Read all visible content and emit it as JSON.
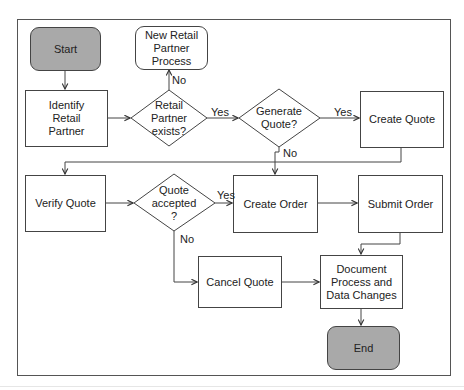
{
  "diagram": {
    "type": "flowchart",
    "nodes": {
      "start": {
        "label": "Start",
        "shape": "rounded-rect",
        "fill": "#a9a9a9"
      },
      "new_partner": {
        "label": "New Retail\nPartner\nProcess",
        "shape": "rounded-rect"
      },
      "identify": {
        "label": "Identify\nRetail\nPartner",
        "shape": "rect"
      },
      "partner_exists": {
        "label": "Retail\nPartner\nexists?",
        "shape": "diamond"
      },
      "generate_quote": {
        "label": "Generate\nQuote?",
        "shape": "diamond"
      },
      "create_quote": {
        "label": "Create Quote",
        "shape": "rect"
      },
      "verify_quote": {
        "label": "Verify Quote",
        "shape": "rect"
      },
      "quote_accepted": {
        "label": "Quote\naccepted\n?",
        "shape": "diamond"
      },
      "create_order": {
        "label": "Create Order",
        "shape": "rect"
      },
      "submit_order": {
        "label": "Submit Order",
        "shape": "rect"
      },
      "cancel_quote": {
        "label": "Cancel Quote",
        "shape": "rect"
      },
      "document": {
        "label": "Document\nProcess and\nData Changes",
        "shape": "rect"
      },
      "end": {
        "label": "End",
        "shape": "rounded-rect",
        "fill": "#a9a9a9"
      }
    },
    "edge_labels": {
      "partner_no": "No",
      "partner_yes": "Yes",
      "generate_yes": "Yes",
      "generate_no": "No",
      "accepted_yes": "Yes",
      "accepted_no": "No"
    },
    "edges": [
      {
        "from": "Start",
        "to": "Identify Retail Partner"
      },
      {
        "from": "Identify Retail Partner",
        "to": "Retail Partner exists?"
      },
      {
        "from": "Retail Partner exists?",
        "to": "New Retail Partner Process",
        "label": "No"
      },
      {
        "from": "Retail Partner exists?",
        "to": "Generate Quote?",
        "label": "Yes"
      },
      {
        "from": "Generate Quote?",
        "to": "Create Quote",
        "label": "Yes"
      },
      {
        "from": "Generate Quote?",
        "to": "Create Order",
        "label": "No"
      },
      {
        "from": "Create Quote",
        "to": "Verify Quote"
      },
      {
        "from": "Verify Quote",
        "to": "Quote accepted?"
      },
      {
        "from": "Quote accepted?",
        "to": "Create Order",
        "label": "Yes"
      },
      {
        "from": "Quote accepted?",
        "to": "Cancel Quote",
        "label": "No"
      },
      {
        "from": "Create Order",
        "to": "Submit Order"
      },
      {
        "from": "Submit Order",
        "to": "Document Process and Data Changes"
      },
      {
        "from": "Cancel Quote",
        "to": "Document Process and Data Changes"
      },
      {
        "from": "Document Process and Data Changes",
        "to": "End"
      }
    ],
    "colors": {
      "terminal_fill": "#a9a9a9",
      "stroke": "#444444",
      "background": "#ffffff"
    }
  }
}
